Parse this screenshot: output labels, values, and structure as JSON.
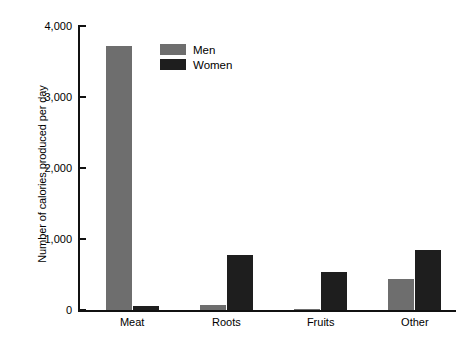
{
  "chart_data": {
    "type": "bar",
    "title": "",
    "subtitle": "",
    "xlabel": "",
    "ylabel": "Number of calories produced per day",
    "categories": [
      "Meat",
      "Roots",
      "Fruits",
      "Other"
    ],
    "series": [
      {
        "name": "Men",
        "color": "#6e6e6e",
        "values": [
          3720,
          70,
          20,
          440
        ]
      },
      {
        "name": "Women",
        "color": "#1e1e1e",
        "values": [
          55,
          780,
          530,
          850
        ]
      }
    ],
    "ylim": [
      0,
      4000
    ],
    "yticks": [
      0,
      1000,
      2000,
      3000,
      4000
    ],
    "ytick_labels": [
      "0",
      "1,000",
      "2,000",
      "3,000",
      "4,000"
    ],
    "grid": false,
    "legend_position": "top-left-inside",
    "legend_entries": [
      "Men",
      "Women"
    ],
    "background_color": "#ffffff",
    "axis_color": "#111111"
  },
  "axis": {
    "y_title": "Number of calories produced per day",
    "tick_0": "0",
    "tick_1000": "1,000",
    "tick_2000": "2,000",
    "tick_3000": "3,000",
    "tick_4000": "4,000"
  },
  "categories": {
    "c0": "Meat",
    "c1": "Roots",
    "c2": "Fruits",
    "c3": "Other"
  },
  "legend": {
    "men": "Men",
    "women": "Women"
  }
}
